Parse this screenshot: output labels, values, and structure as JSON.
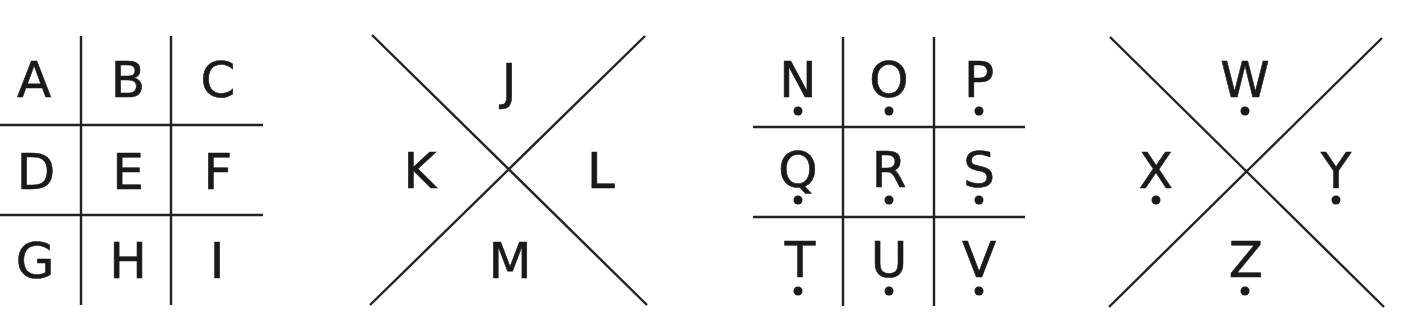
{
  "colors": {
    "ink": "#1a1a1a",
    "background": "#ffffff"
  },
  "panels": [
    {
      "id": "grid-plain",
      "type": "grid",
      "dotted": false,
      "letters": [
        "A",
        "B",
        "C",
        "D",
        "E",
        "F",
        "G",
        "H",
        "I"
      ]
    },
    {
      "id": "x-plain",
      "type": "x",
      "dotted": false,
      "letters": [
        "J",
        "K",
        "L",
        "M"
      ],
      "positions": [
        "top",
        "left",
        "right",
        "bottom"
      ]
    },
    {
      "id": "grid-dotted",
      "type": "grid",
      "dotted": true,
      "letters": [
        "N",
        "O",
        "P",
        "Q",
        "R",
        "S",
        "T",
        "U",
        "V"
      ]
    },
    {
      "id": "x-dotted",
      "type": "x",
      "dotted": true,
      "letters": [
        "W",
        "X",
        "Y",
        "Z"
      ],
      "positions": [
        "top",
        "left",
        "right",
        "bottom"
      ]
    }
  ]
}
